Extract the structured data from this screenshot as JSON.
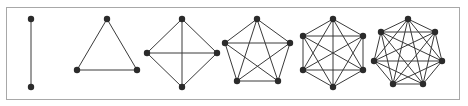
{
  "figure": {
    "frame": {
      "x": 6,
      "y": 7,
      "width": 453,
      "height": 92,
      "stroke": "#a8a8a8"
    },
    "colors": {
      "edge": "#3a3a3a",
      "node": "#2b2b2b",
      "background": "#ffffff"
    },
    "node_radius": 3.2,
    "graphs": [
      {
        "name": "K2",
        "nodes": [
          [
            31,
            19
          ],
          [
            31,
            87
          ]
        ]
      },
      {
        "name": "K3",
        "nodes": [
          [
            107,
            19
          ],
          [
            137,
            70
          ],
          [
            77,
            70
          ]
        ]
      },
      {
        "name": "K4",
        "nodes": [
          [
            182,
            19
          ],
          [
            217,
            53
          ],
          [
            182,
            87
          ],
          [
            147,
            53
          ]
        ]
      },
      {
        "name": "K5",
        "nodes": [
          [
            257,
            19
          ],
          [
            290,
            43
          ],
          [
            278,
            81
          ],
          [
            237,
            81
          ],
          [
            225,
            43
          ]
        ]
      },
      {
        "name": "K6",
        "nodes": [
          [
            333,
            19
          ],
          [
            363,
            36
          ],
          [
            363,
            70
          ],
          [
            333,
            87
          ],
          [
            303,
            70
          ],
          [
            303,
            36
          ]
        ]
      },
      {
        "name": "K7",
        "nodes": [
          [
            408,
            19
          ],
          [
            435,
            32
          ],
          [
            442,
            61
          ],
          [
            423,
            84
          ],
          [
            393,
            84
          ],
          [
            374,
            61
          ],
          [
            381,
            32
          ]
        ]
      }
    ]
  }
}
